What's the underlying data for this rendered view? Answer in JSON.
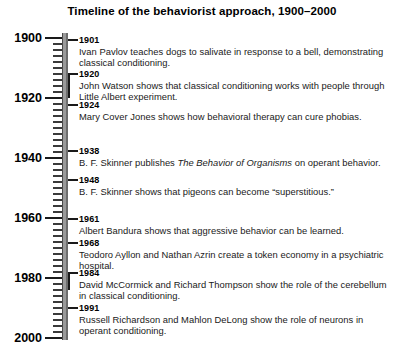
{
  "title": "Timeline of the behaviorist approach, 1900–2000",
  "axis": {
    "start_year": 1900,
    "end_year": 2000,
    "minor_tick_interval_years": 2,
    "major_tick_interval_years": 20,
    "decade_labels": [
      "1900",
      "1920",
      "1940",
      "1960",
      "1980",
      "2000"
    ],
    "decade_values": [
      1900,
      1920,
      1940,
      1960,
      1980,
      2000
    ],
    "axis_color": "#9a9a9a",
    "tick_color": "#1a1a1a"
  },
  "chart_data": {
    "type": "timeline",
    "title": "Timeline of the behaviorist approach, 1900–2000",
    "xlabel": "",
    "ylabel": "",
    "orientation": "vertical",
    "axis_range": [
      1900,
      2000
    ],
    "axis_tick_labels": [
      "1900",
      "1920",
      "1940",
      "1960",
      "1980",
      "2000"
    ],
    "axis_tick_values": [
      1900,
      1920,
      1940,
      1960,
      1980,
      2000
    ],
    "minor_tick_interval": 2,
    "grid": false,
    "legend": "none",
    "events": [
      {
        "year": 1901,
        "year_label": "1901",
        "text": "Ivan Pavlov teaches dogs to salivate in response to a bell, demonstrating classical conditioning.",
        "connector": "straight"
      },
      {
        "year": 1920,
        "year_label": "1920",
        "text": "John Watson shows that classical conditioning works with people through Little Albert experiment.",
        "connector": "elbow"
      },
      {
        "year": 1924,
        "year_label": "1924",
        "text": "Mary Cover Jones shows how behavioral therapy can cure phobias.",
        "connector": "straight"
      },
      {
        "year": 1938,
        "year_label": "1938",
        "text": "B. F. Skinner publishes The Behavior of Organisms on operant behavior.",
        "text_html": "B. F. Skinner publishes <i>The Behavior of Organisms</i> on operant behavior.",
        "connector": "straight"
      },
      {
        "year": 1948,
        "year_label": "1948",
        "text": "B. F. Skinner shows that pigeons can become “superstitious.”",
        "connector": "straight"
      },
      {
        "year": 1961,
        "year_label": "1961",
        "text": "Albert Bandura shows that aggressive behavior can be learned.",
        "connector": "straight"
      },
      {
        "year": 1968,
        "year_label": "1968",
        "text": "Teodoro Ayllon and Nathan Azrin create a token economy in a psychiatric hospital.",
        "connector": "straight"
      },
      {
        "year": 1984,
        "year_label": "1984",
        "text": "David McCormick and Richard Thompson show the role of the cerebellum in classical conditioning.",
        "connector": "elbow"
      },
      {
        "year": 1991,
        "year_label": "1991",
        "text": "Russell Richardson and Mahlon DeLong show the role of neurons in operant conditioning.",
        "connector": "straight"
      }
    ]
  }
}
